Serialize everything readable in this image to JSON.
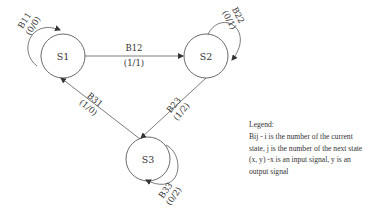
{
  "diagram": {
    "type": "state-machine",
    "states": [
      {
        "id": "S1",
        "label": "S1"
      },
      {
        "id": "S2",
        "label": "S2"
      },
      {
        "id": "S3",
        "label": "S3"
      }
    ],
    "transitions": [
      {
        "id": "B11",
        "from": "S1",
        "to": "S1",
        "label": "B11",
        "signal": "(0/0)"
      },
      {
        "id": "B12",
        "from": "S1",
        "to": "S2",
        "label": "B12",
        "signal": "(1/1)"
      },
      {
        "id": "B22",
        "from": "S2",
        "to": "S2",
        "label": "B22",
        "signal": "(0/1)"
      },
      {
        "id": "B23",
        "from": "S2",
        "to": "S3",
        "label": "B23",
        "signal": "(1/2)"
      },
      {
        "id": "B31",
        "from": "S3",
        "to": "S1",
        "label": "B31",
        "signal": "(1/0)"
      },
      {
        "id": "B33",
        "from": "S3",
        "to": "S3",
        "label": "B33",
        "signal": "(0/2)"
      }
    ]
  },
  "legend": {
    "title": "Legend:",
    "lines": [
      "Bij - i is the number of the current",
      "state, j is the number of the next state",
      "(x, y) -x is an input signal, y is an",
      "output signal"
    ]
  }
}
